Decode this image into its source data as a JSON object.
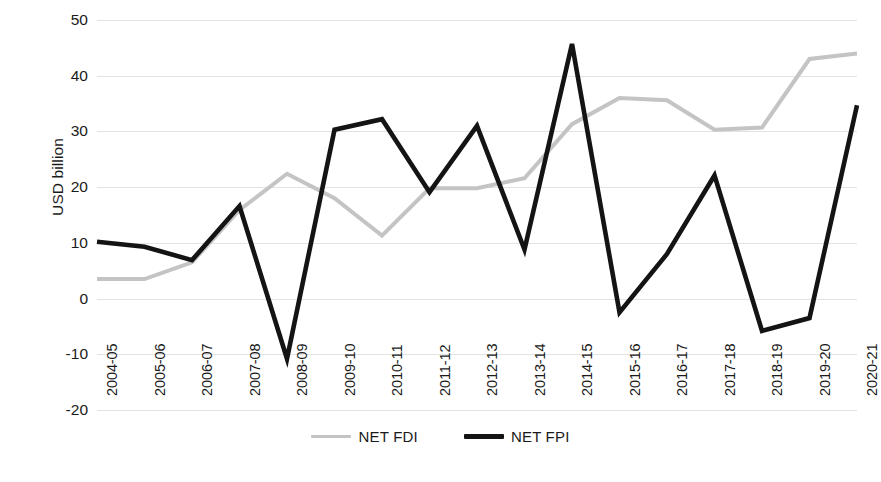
{
  "chart_data": {
    "type": "line",
    "title": "",
    "xlabel": "",
    "ylabel": "USD billion",
    "ylim": [
      -20,
      50
    ],
    "yticks": [
      50,
      40,
      30,
      20,
      10,
      0,
      -10,
      -20
    ],
    "grid": true,
    "legend_position": "bottom",
    "categories": [
      "2004-05",
      "2005-06",
      "2006-07",
      "2007-08",
      "2008-09",
      "2009-10",
      "2010-11",
      "2011-12",
      "2012-13",
      "2013-14",
      "2014-15",
      "2015-16",
      "2016-17",
      "2017-18",
      "2018-19",
      "2019-20",
      "2020-21"
    ],
    "series": [
      {
        "name": "NET FDI",
        "color": "#c4c4c4",
        "values": [
          3.5,
          3.5,
          6.5,
          15.9,
          22.4,
          18.0,
          11.3,
          19.8,
          19.8,
          21.6,
          31.3,
          36.0,
          35.6,
          30.3,
          30.7,
          43.0,
          44.0
        ]
      },
      {
        "name": "NET FPI",
        "color": "#141414",
        "values": [
          10.2,
          9.3,
          6.9,
          16.6,
          -10.8,
          30.3,
          32.2,
          19.1,
          31.0,
          8.8,
          45.7,
          -2.5,
          8.0,
          22.1,
          -5.8,
          -3.5,
          34.7
        ]
      }
    ]
  },
  "axis": {
    "y_title": "USD billion",
    "y_tick_labels": [
      "50",
      "40",
      "30",
      "20",
      "10",
      "0",
      "-10",
      "-20"
    ],
    "x_tick_labels": [
      "2004-05",
      "2005-06",
      "2006-07",
      "2007-08",
      "2008-09",
      "2009-10",
      "2010-11",
      "2011-12",
      "2012-13",
      "2013-14",
      "2014-15",
      "2015-16",
      "2016-17",
      "2017-18",
      "2018-19",
      "2019-20",
      "2020-21"
    ]
  },
  "legend": {
    "entries": [
      {
        "label": "NET FDI",
        "color": "#c4c4c4"
      },
      {
        "label": "NET FPI",
        "color": "#141414"
      }
    ]
  },
  "colors": {
    "fdi_line": "#c4c4c4",
    "fpi_line": "#141414",
    "gridline": "#e3e3e3",
    "text": "#1a1a1a",
    "background": "#ffffff"
  }
}
